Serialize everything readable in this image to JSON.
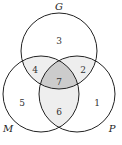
{
  "diagram": {
    "type": "venn-3",
    "sets": {
      "G": {
        "label": "G"
      },
      "M": {
        "label": "M"
      },
      "P": {
        "label": "P"
      }
    },
    "regions": {
      "G_only": "3",
      "G_P": "2",
      "G_M": "4",
      "G_M_P": "7",
      "M_only": "5",
      "P_only": "1",
      "M_P": "6"
    },
    "colors": {
      "stroke": "#222222",
      "pair_fill": "#eeeeee",
      "triple_fill": "#cccccc"
    }
  }
}
